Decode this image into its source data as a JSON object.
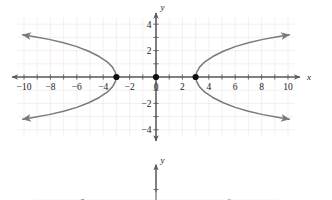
{
  "figure": {
    "background_color": "#ffffff",
    "grid_color": "#f0e8ea",
    "axis_color": "#5a5a5a",
    "curve_color": "#7a7a7a",
    "point_color": "#111111",
    "label_color": "#1a1a1a"
  },
  "chart_data": {
    "type": "line",
    "title": "",
    "subtitle": "",
    "xlabel": "x",
    "ylabel": "y",
    "xlim": [
      -10.6,
      10.6
    ],
    "ylim": [
      -4.6,
      4.6
    ],
    "grid": true,
    "grid_step": 1,
    "legend": "none",
    "x_ticks": [
      -10,
      -8,
      -6,
      -4,
      -2,
      0,
      2,
      4,
      6,
      8,
      10
    ],
    "x_tick_labels": [
      "−10",
      "−8",
      "−6",
      "−4",
      "−2",
      "0",
      "2",
      "4",
      "6",
      "8",
      "10"
    ],
    "x_minor_ticks": [
      -9,
      -7,
      -5,
      -3,
      -1,
      1,
      3,
      5,
      7,
      9
    ],
    "y_ticks": [
      -4,
      -2,
      2,
      4
    ],
    "y_tick_labels": [
      "−4",
      "−2",
      "2",
      "4"
    ],
    "y_minor_ticks": [
      -3,
      -1,
      1,
      3
    ],
    "curve_label": "hyperbola opening left and right",
    "vertices": [
      {
        "x": -3,
        "y": 0,
        "label": "left-vertex"
      },
      {
        "x": 3,
        "y": 0,
        "label": "right-vertex"
      }
    ],
    "center": {
      "x": 0,
      "y": 0,
      "label": "origin-point"
    },
    "branches": [
      {
        "name": "left-branch-upper",
        "points": [
          [
            -3,
            0
          ],
          [
            -3.08,
            0.35
          ],
          [
            -3.3,
            0.75
          ],
          [
            -3.7,
            1.15
          ],
          [
            -4.3,
            1.55
          ],
          [
            -5.1,
            1.95
          ],
          [
            -6.0,
            2.3
          ],
          [
            -7.0,
            2.6
          ],
          [
            -8.1,
            2.85
          ],
          [
            -9.2,
            3.05
          ],
          [
            -10.1,
            3.2
          ]
        ],
        "arrow_end": true
      },
      {
        "name": "left-branch-lower",
        "points": [
          [
            -3,
            0
          ],
          [
            -3.08,
            -0.35
          ],
          [
            -3.3,
            -0.75
          ],
          [
            -3.7,
            -1.15
          ],
          [
            -4.3,
            -1.55
          ],
          [
            -5.1,
            -1.95
          ],
          [
            -6.0,
            -2.3
          ],
          [
            -7.0,
            -2.6
          ],
          [
            -8.1,
            -2.85
          ],
          [
            -9.2,
            -3.05
          ],
          [
            -10.1,
            -3.2
          ]
        ],
        "arrow_end": true
      },
      {
        "name": "right-branch-upper",
        "points": [
          [
            3,
            0
          ],
          [
            3.08,
            0.35
          ],
          [
            3.3,
            0.75
          ],
          [
            3.7,
            1.15
          ],
          [
            4.3,
            1.55
          ],
          [
            5.1,
            1.95
          ],
          [
            6.0,
            2.3
          ],
          [
            7.0,
            2.6
          ],
          [
            8.1,
            2.85
          ],
          [
            9.2,
            3.05
          ],
          [
            10.1,
            3.2
          ]
        ],
        "arrow_end": true
      },
      {
        "name": "right-branch-lower",
        "points": [
          [
            3,
            0
          ],
          [
            3.08,
            -0.35
          ],
          [
            3.3,
            -0.75
          ],
          [
            3.7,
            -1.15
          ],
          [
            4.3,
            -1.55
          ],
          [
            5.1,
            -1.95
          ],
          [
            6.0,
            -2.3
          ],
          [
            7.0,
            -2.6
          ],
          [
            8.1,
            -2.85
          ],
          [
            9.2,
            -3.05
          ],
          [
            10.1,
            -3.2
          ]
        ],
        "arrow_end": true
      }
    ]
  },
  "second_chart": {
    "type": "line",
    "label": "partially visible graph below",
    "ylabel": "y",
    "xlabel": "",
    "note": "cropped at bottom edge of image"
  }
}
